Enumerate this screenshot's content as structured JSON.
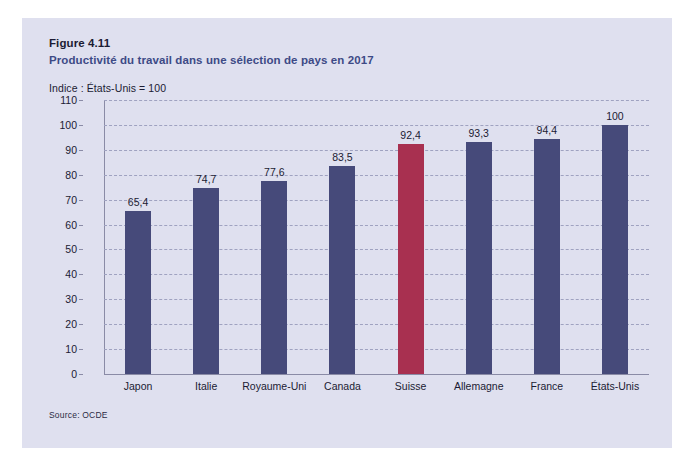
{
  "figure": {
    "number": "Figure 4.11",
    "subtitle": "Productivité du travail dans une sélection de pays en 2017",
    "axis_note": "Indice : États-Unis = 100",
    "source": "Source: OCDE"
  },
  "colors": {
    "panel_background": "#dfe0ef",
    "bar_default": "#464a7a",
    "bar_highlight": "#a83050",
    "subtitle": "#3d4a86",
    "gridline": "#9fa2c0",
    "axis": "#8a8ba6",
    "text": "#1b1b33"
  },
  "chart_data": {
    "type": "bar",
    "title": "Productivité du travail dans une sélection de pays en 2017",
    "subtitle": "Indice : États-Unis = 100",
    "xlabel": "",
    "ylabel": "",
    "ylim": [
      0,
      110
    ],
    "ytick_step": 10,
    "yticks": [
      0,
      10,
      20,
      30,
      40,
      50,
      60,
      70,
      80,
      90,
      100,
      110
    ],
    "ytick_labels": [
      "0",
      "10",
      "20",
      "30",
      "40",
      "50",
      "60",
      "70",
      "80",
      "90",
      "100",
      "110"
    ],
    "grid": true,
    "legend": "none",
    "categories": [
      "Japon",
      "Italie",
      "Royaume-Uni",
      "Canada",
      "Suisse",
      "Allemagne",
      "France",
      "États-Unis"
    ],
    "values": [
      65.4,
      74.7,
      77.6,
      83.5,
      92.4,
      93.3,
      94.4,
      100
    ],
    "value_labels": [
      "65,4",
      "74,7",
      "77,6",
      "83,5",
      "92,4",
      "93,3",
      "94,4",
      "100"
    ],
    "highlight_index": 4,
    "source": "Source: OCDE"
  }
}
